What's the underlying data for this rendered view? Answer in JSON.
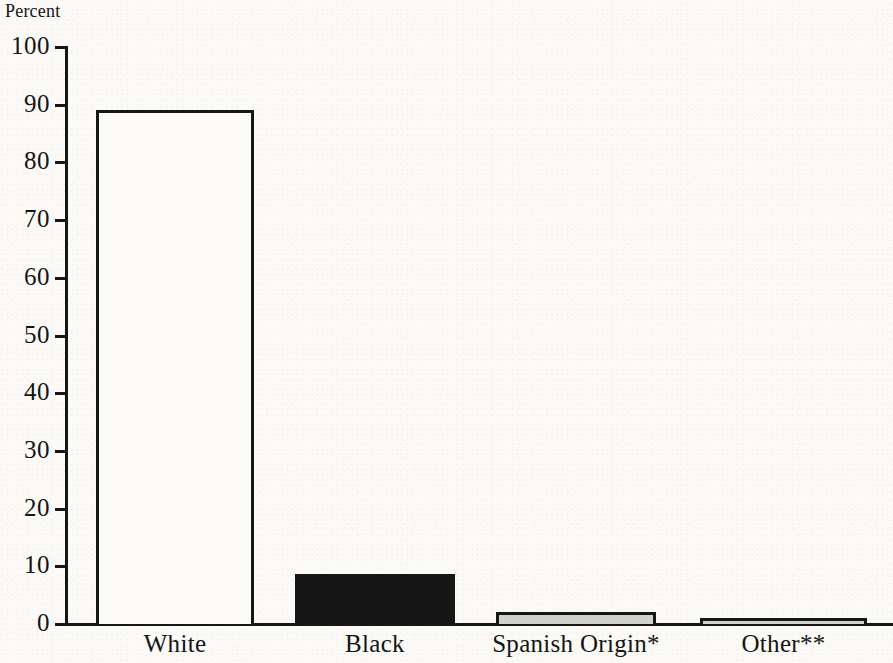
{
  "chart_data": {
    "type": "bar",
    "title": "",
    "subtitle": "",
    "xlabel": "",
    "ylabel": "Percent",
    "ylim": [
      0,
      100
    ],
    "yticks": [
      0,
      10,
      20,
      30,
      40,
      50,
      60,
      70,
      80,
      90,
      100
    ],
    "ytick_labels": [
      "0",
      "10",
      "20",
      "30",
      "40",
      "50",
      "60",
      "70",
      "80",
      "90",
      "100"
    ],
    "grid": false,
    "legend": null,
    "categories": [
      "White",
      "Black",
      "Spanish Origin*",
      "Other**"
    ],
    "values": [
      89,
      8.6,
      2,
      1
    ],
    "bar_styles": [
      "white-filled-black-outline",
      "solid-black",
      "light-gray-black-outline",
      "light-gray-black-outline"
    ],
    "annotations": []
  },
  "axis": {
    "y_title": "Percent"
  },
  "colors": {
    "background": "#fbfaf7",
    "ink": "#161616",
    "gray_fill": "#cfcfcb"
  }
}
